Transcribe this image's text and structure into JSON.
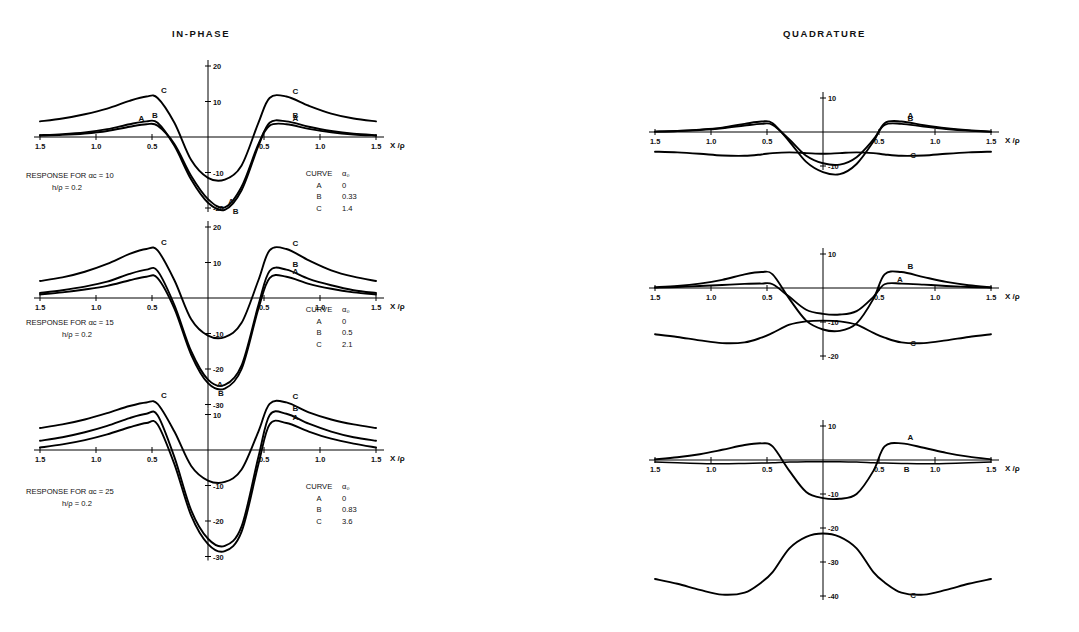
{
  "titles": {
    "inphase": "IN-PHASE",
    "quadrature": "QUADRATURE"
  },
  "axis": {
    "xlabel": "X /ρ",
    "xticks": [
      "1.5",
      "1.0",
      "0.5",
      "0.5",
      "1.0",
      "1.5"
    ]
  },
  "curve_labels": {
    "a": "A",
    "b": "B",
    "c": "C"
  },
  "legend_headers": {
    "curve": "CURVE",
    "alpha": "α₀"
  },
  "panels": [
    {
      "id": "inphase-1",
      "response_line1": "RESPONSE FOR αc = 10",
      "response_line2": "h/ρ   = 0.2",
      "yticks": [
        "20",
        "10",
        "-10",
        "-20"
      ],
      "legend_rows": [
        {
          "curve": "A",
          "alpha": "0"
        },
        {
          "curve": "B",
          "alpha": "0.33"
        },
        {
          "curve": "C",
          "alpha": "1.4"
        }
      ]
    },
    {
      "id": "inphase-2",
      "response_line1": "RESPONSE FOR αc = 15",
      "response_line2": "h/ρ  = 0.2",
      "yticks": [
        "20",
        "10",
        "-10",
        "-20",
        "-30"
      ],
      "legend_rows": [
        {
          "curve": "A",
          "alpha": "0"
        },
        {
          "curve": "B",
          "alpha": "0.5"
        },
        {
          "curve": "C",
          "alpha": "2.1"
        }
      ]
    },
    {
      "id": "inphase-3",
      "response_line1": "RESPONSE FOR αc = 25",
      "response_line2": "h/ρ = 0.2",
      "yticks": [
        "10",
        "-10",
        "-20",
        "-30"
      ],
      "legend_rows": [
        {
          "curve": "A",
          "alpha": "0"
        },
        {
          "curve": "B",
          "alpha": "0.83"
        },
        {
          "curve": "C",
          "alpha": "3.6"
        }
      ]
    },
    {
      "id": "quad-1",
      "yticks": [
        "10",
        "-10"
      ]
    },
    {
      "id": "quad-2",
      "yticks": [
        "10",
        "-10",
        "-20"
      ]
    },
    {
      "id": "quad-3",
      "yticks": [
        "10",
        "-10",
        "-20",
        "-30",
        "-40"
      ]
    }
  ],
  "chart_data": {
    "type": "line",
    "xlabel": "X /ρ",
    "ylabel": "response (%)",
    "x": [
      -1.5,
      -1.3,
      -1.1,
      -0.9,
      -0.7,
      -0.55,
      -0.45,
      -0.3,
      -0.15,
      0.0,
      0.15,
      0.3,
      0.45,
      0.55,
      0.7,
      0.9,
      1.1,
      1.3,
      1.5
    ],
    "xlim": [
      -1.5,
      1.5
    ],
    "grid": false,
    "legend_position": "right-inside",
    "charts": [
      {
        "panel": "inphase-1",
        "condition": {
          "alpha_c": 10,
          "h_over_rho": 0.2
        },
        "ylim": [
          -22,
          20
        ],
        "yticks": [
          20,
          10,
          0,
          -10,
          -20
        ],
        "series": [
          {
            "name": "A",
            "alpha_0": 0,
            "values": [
              0.4,
              0.6,
              1.0,
              1.7,
              2.9,
              3.6,
              3.2,
              -2.0,
              -11.0,
              -17.5,
              -19.8,
              -14.0,
              -2.0,
              3.2,
              3.6,
              2.3,
              1.3,
              0.7,
              0.4
            ]
          },
          {
            "name": "B",
            "alpha_0": 0.33,
            "values": [
              0.5,
              0.8,
              1.3,
              2.2,
              3.6,
              4.4,
              4.0,
              -2.5,
              -12.0,
              -18.5,
              -20.5,
              -15.0,
              -2.5,
              4.0,
              4.4,
              2.9,
              1.7,
              0.9,
              0.5
            ]
          },
          {
            "name": "C",
            "alpha_0": 1.4,
            "values": [
              4.4,
              5.2,
              6.4,
              8.0,
              10.2,
              11.4,
              11.0,
              4.0,
              -6.5,
              -11.5,
              -12.0,
              -8.0,
              4.0,
              11.0,
              11.4,
              8.8,
              6.6,
              5.2,
              4.4
            ]
          }
        ]
      },
      {
        "panel": "inphase-2",
        "condition": {
          "alpha_c": 15,
          "h_over_rho": 0.2
        },
        "ylim": [
          -30,
          20
        ],
        "yticks": [
          20,
          10,
          0,
          -10,
          -20,
          -30
        ],
        "series": [
          {
            "name": "A",
            "alpha_0": 0,
            "values": [
              1.0,
              1.6,
              2.4,
              3.4,
              5.0,
              6.0,
              5.6,
              -3.0,
              -16.0,
              -24.0,
              -25.5,
              -20.0,
              -3.0,
              5.6,
              6.0,
              4.0,
              2.6,
              1.6,
              1.0
            ]
          },
          {
            "name": "B",
            "alpha_0": 0.5,
            "values": [
              1.4,
              2.2,
              3.2,
              4.6,
              6.8,
              8.0,
              7.6,
              -2.0,
              -15.0,
              -23.0,
              -24.5,
              -19.0,
              -2.0,
              7.6,
              8.0,
              5.4,
              3.6,
              2.2,
              1.4
            ]
          },
          {
            "name": "C",
            "alpha_0": 2.1,
            "values": [
              4.8,
              5.8,
              7.4,
              9.6,
              12.4,
              13.8,
              13.4,
              5.0,
              -6.0,
              -10.6,
              -11.0,
              -7.0,
              5.0,
              13.4,
              13.8,
              10.6,
              7.8,
              6.0,
              4.8
            ]
          }
        ]
      },
      {
        "panel": "inphase-3",
        "condition": {
          "alpha_c": 25,
          "h_over_rho": 0.2
        },
        "ylim": [
          -31,
          12
        ],
        "yticks": [
          10,
          0,
          -10,
          -20,
          -30
        ],
        "series": [
          {
            "name": "A",
            "alpha_0": 0,
            "values": [
              0.7,
              1.6,
              2.8,
              4.4,
              6.4,
              7.6,
              7.2,
              -4.0,
              -18.5,
              -26.5,
              -28.5,
              -23.0,
              -4.0,
              7.2,
              7.6,
              5.2,
              3.2,
              1.8,
              0.7
            ]
          },
          {
            "name": "B",
            "alpha_0": 0.83,
            "values": [
              2.6,
              3.6,
              5.0,
              6.8,
              9.0,
              10.2,
              9.8,
              -2.0,
              -17.0,
              -25.0,
              -27.0,
              -21.5,
              -2.0,
              9.8,
              10.2,
              7.4,
              5.2,
              3.6,
              2.6
            ]
          },
          {
            "name": "C",
            "alpha_0": 3.6,
            "values": [
              6.2,
              7.2,
              8.6,
              10.4,
              12.4,
              13.4,
              13.0,
              5.2,
              -4.5,
              -8.6,
              -9.0,
              -5.5,
              5.2,
              13.0,
              13.4,
              10.6,
              8.6,
              7.2,
              6.2
            ]
          }
        ]
      },
      {
        "panel": "quad-1",
        "condition": {
          "alpha_c": 10,
          "h_over_rho": 0.2
        },
        "ylim": [
          -14,
          10
        ],
        "yticks": [
          10,
          0,
          -10
        ],
        "series": [
          {
            "name": "A",
            "alpha_0": 0,
            "values": [
              0.1,
              0.3,
              0.7,
              1.3,
              2.4,
              3.1,
              2.6,
              -2.8,
              -8.8,
              -11.8,
              -12.4,
              -9.4,
              -2.8,
              2.6,
              3.1,
              2.0,
              1.1,
              0.5,
              0.1
            ]
          },
          {
            "name": "B",
            "alpha_0": 0.33,
            "values": [
              0.1,
              0.3,
              0.6,
              1.1,
              1.9,
              2.4,
              2.1,
              -2.2,
              -7.0,
              -9.2,
              -9.6,
              -7.4,
              -2.2,
              2.1,
              2.4,
              1.6,
              0.9,
              0.4,
              0.1
            ]
          },
          {
            "name": "C",
            "alpha_0": 1.4,
            "values": [
              -5.8,
              -6.0,
              -6.4,
              -6.9,
              -7.0,
              -6.6,
              -6.2,
              -6.0,
              -6.2,
              -6.4,
              -6.2,
              -6.0,
              -6.2,
              -6.6,
              -7.0,
              -6.9,
              -6.4,
              -6.0,
              -5.8
            ]
          }
        ]
      },
      {
        "panel": "quad-2",
        "condition": {
          "alpha_c": 15,
          "h_over_rho": 0.2
        },
        "ylim": [
          -22,
          10
        ],
        "yticks": [
          10,
          0,
          -10,
          -20
        ],
        "series": [
          {
            "name": "A",
            "alpha_0": 0,
            "values": [
              0.1,
              0.3,
              0.6,
              0.9,
              1.2,
              1.3,
              1.1,
              -2.6,
              -6.4,
              -7.6,
              -7.8,
              -6.8,
              -2.6,
              1.1,
              1.3,
              1.0,
              0.6,
              0.3,
              0.1
            ]
          },
          {
            "name": "B",
            "alpha_0": 0.5,
            "values": [
              0.2,
              0.6,
              1.3,
              2.4,
              4.0,
              4.7,
              4.0,
              -3.2,
              -9.6,
              -12.2,
              -12.6,
              -10.4,
              -3.2,
              4.0,
              4.7,
              3.2,
              1.8,
              0.8,
              0.2
            ]
          },
          {
            "name": "C",
            "alpha_0": 2.1,
            "values": [
              -13.6,
              -14.4,
              -15.4,
              -16.2,
              -16.0,
              -14.6,
              -13.2,
              -10.8,
              -9.8,
              -9.6,
              -9.8,
              -10.8,
              -13.2,
              -14.6,
              -16.0,
              -16.2,
              -15.4,
              -14.4,
              -13.6
            ]
          }
        ]
      },
      {
        "panel": "quad-3",
        "condition": {
          "alpha_c": 25,
          "h_over_rho": 0.2
        },
        "ylim": [
          -41,
          10
        ],
        "yticks": [
          10,
          0,
          -10,
          -20,
          -30,
          -40
        ],
        "series": [
          {
            "name": "A",
            "alpha_0": 0,
            "values": [
              0.2,
              0.8,
              1.7,
              3.0,
              4.4,
              4.9,
              4.0,
              -3.2,
              -9.4,
              -11.2,
              -11.4,
              -10.0,
              -3.2,
              4.0,
              4.9,
              3.6,
              2.1,
              1.0,
              0.2
            ]
          },
          {
            "name": "B",
            "alpha_0": 0.83,
            "values": [
              -0.6,
              -0.8,
              -1.0,
              -1.1,
              -1.0,
              -0.9,
              -0.8,
              -0.6,
              -0.5,
              -0.5,
              -0.5,
              -0.6,
              -0.8,
              -0.9,
              -1.0,
              -1.1,
              -1.0,
              -0.8,
              -0.6
            ]
          },
          {
            "name": "C",
            "alpha_0": 3.6,
            "values": [
              -35.0,
              -36.4,
              -38.2,
              -39.6,
              -39.0,
              -36.0,
              -33.0,
              -26.0,
              -22.6,
              -21.6,
              -22.6,
              -26.0,
              -33.0,
              -36.0,
              -39.0,
              -39.6,
              -38.2,
              -36.4,
              -35.0
            ]
          }
        ]
      }
    ]
  }
}
